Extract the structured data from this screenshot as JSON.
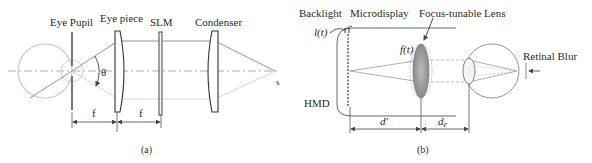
{
  "figure_a": {
    "caption": "(a)",
    "labels": {
      "eye_pupil": "Eye Pupil",
      "eye_piece": "Eye piece",
      "slm": "SLM",
      "condenser": "Condenser",
      "theta": "θ",
      "source": "s",
      "f_left": "f",
      "f_right": "f"
    }
  },
  "figure_b": {
    "caption": "(b)",
    "labels": {
      "backlight": "Backlight",
      "microdisplay": "Microdisplay",
      "focus_tunable_lens": "Focus-tunable Lens",
      "retinal_blur": "Retinal Blur",
      "l_t": "l(t)",
      "f_t": "f(t)",
      "hmd": "HMD",
      "d_prime": "d′",
      "d_e": "d",
      "d_e_sub": "e"
    }
  },
  "colors": {
    "line": "#555555",
    "light_line": "#aaaaaa",
    "lens_fill": "#9a9a9a",
    "text": "#2a2a2a"
  }
}
